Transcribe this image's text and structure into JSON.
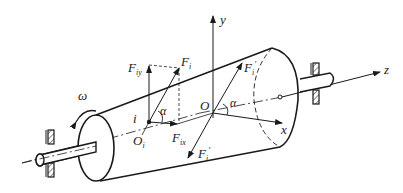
{
  "diagram": {
    "type": "tapered-roller-force-diagram",
    "colors": {
      "stroke": "#1a1a1a",
      "background": "#ffffff"
    },
    "labels": {
      "y_axis": "y",
      "z_axis": "z",
      "x_axis": "x",
      "origin": "O",
      "omega": "ω",
      "point_i": "i",
      "point_Oi": "O",
      "point_Oi_sub": "i",
      "alpha_left": "α",
      "alpha_center": "α",
      "F_i": "F",
      "F_i_sub": "i",
      "F_iy": "F",
      "F_iy_sub": "iy",
      "F_ix": "F",
      "F_ix_sub": "ix",
      "F_i_prime_upper": "F",
      "F_i_prime_upper_sub": "i",
      "F_i_prime_upper_sup": "′",
      "F_i_prime_lower": "F",
      "F_i_prime_lower_sub": "i",
      "F_i_prime_lower_sup": "′"
    }
  }
}
